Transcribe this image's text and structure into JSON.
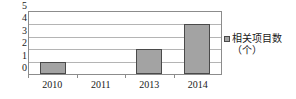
{
  "chart_data": {
    "type": "bar",
    "title": "",
    "xlabel": "",
    "ylabel": "",
    "categories": [
      "2010",
      "2011",
      "2013",
      "2014"
    ],
    "values": [
      1,
      0,
      2,
      4
    ],
    "series": [
      {
        "name": "相关项目数（个）",
        "values": [
          1,
          0,
          2,
          4
        ]
      }
    ],
    "ylim": [
      0,
      5
    ],
    "y_ticks": [
      "5",
      "4",
      "3",
      "2",
      "1",
      "0"
    ],
    "y_tick_values": [
      5,
      4,
      3,
      2,
      1,
      0
    ],
    "grid": "horizontal",
    "legend_position": "right",
    "legend_entries": [
      "相关项目数（个）"
    ],
    "colors": {
      "bar_fill": "#a3a3a3",
      "bar_border": "#4a4a4a",
      "axis": "#8c8c8c",
      "gridline": "#b4b4b4",
      "text": "#1a1a1a",
      "background": "#ffffff"
    }
  },
  "legend": {
    "marker_icon": "square-marker-icon",
    "label_line1": "相关项目",
    "label_line2": "数（个）",
    "label_full": "相关项目数（个）"
  },
  "y_axis": {
    "t0": "5",
    "t1": "4",
    "t2": "3",
    "t3": "2",
    "t4": "1",
    "t5": "0"
  },
  "x_axis": {
    "c0": "2010",
    "c1": "2011",
    "c2": "2013",
    "c3": "2014"
  }
}
